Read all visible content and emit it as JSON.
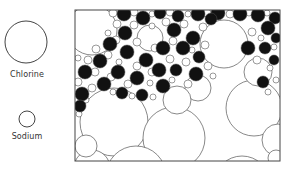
{
  "legend": {
    "chlorine": {
      "label": "Chlorine",
      "cx": 26,
      "cy": 42,
      "r": 21
    },
    "sodium": {
      "label": "Sodium",
      "cx": 27,
      "cy": 119,
      "r": 8
    }
  },
  "frame": {
    "x": 75,
    "y": 10,
    "width": 205,
    "height": 151
  },
  "colors": {
    "stroke": "#555555",
    "fill_dark": "#111111",
    "fill_light": "#ffffff",
    "text": "#333333"
  },
  "large_circles": [
    [
      92,
      30,
      25
    ],
    [
      224,
      44,
      24
    ],
    [
      114,
      122,
      34
    ],
    [
      174,
      138,
      31
    ],
    [
      254,
      108,
      28
    ],
    [
      136,
      176,
      30
    ],
    [
      198,
      196,
      34
    ],
    [
      92,
      168,
      18
    ],
    [
      86,
      146,
      11
    ],
    [
      198,
      88,
      13
    ],
    [
      242,
      184,
      28
    ],
    [
      278,
      140,
      16
    ],
    [
      276,
      158,
      8
    ],
    [
      177,
      100,
      14
    ],
    [
      150,
      38,
      13
    ],
    [
      258,
      72,
      14
    ]
  ],
  "dark_circles": [
    [
      124,
      14,
      7
    ],
    [
      143,
      18,
      7
    ],
    [
      160,
      13,
      6
    ],
    [
      178,
      16,
      6
    ],
    [
      198,
      14,
      7
    ],
    [
      218,
      13,
      7
    ],
    [
      240,
      14,
      7
    ],
    [
      258,
      15,
      7
    ],
    [
      275,
      18,
      6
    ],
    [
      125,
      33,
      7
    ],
    [
      174,
      30,
      7
    ],
    [
      193,
      38,
      7
    ],
    [
      211,
      19,
      6
    ],
    [
      268,
      28,
      7
    ],
    [
      110,
      44,
      7
    ],
    [
      127,
      52,
      7
    ],
    [
      146,
      60,
      7
    ],
    [
      163,
      48,
      7
    ],
    [
      183,
      48,
      7
    ],
    [
      199,
      57,
      6
    ],
    [
      248,
      48,
      7
    ],
    [
      265,
      48,
      6
    ],
    [
      276,
      38,
      5
    ],
    [
      100,
      61,
      7
    ],
    [
      118,
      72,
      7
    ],
    [
      137,
      78,
      7
    ],
    [
      159,
      70,
      7
    ],
    [
      176,
      70,
      6
    ],
    [
      196,
      74,
      7
    ],
    [
      85,
      72,
      7
    ],
    [
      104,
      84,
      7
    ],
    [
      122,
      93,
      6
    ],
    [
      142,
      95,
      6
    ],
    [
      163,
      86,
      7
    ],
    [
      82,
      94,
      7
    ],
    [
      263,
      82,
      6
    ],
    [
      274,
      60,
      5
    ],
    [
      80,
      106,
      6
    ]
  ],
  "small_circles": [
    [
      113,
      13,
      4
    ],
    [
      134,
      12,
      4
    ],
    [
      152,
      14,
      3
    ],
    [
      170,
      12,
      4
    ],
    [
      188,
      14,
      3
    ],
    [
      207,
      13,
      4
    ],
    [
      230,
      14,
      4
    ],
    [
      249,
      12,
      4
    ],
    [
      267,
      13,
      3
    ],
    [
      117,
      24,
      4
    ],
    [
      134,
      25,
      4
    ],
    [
      152,
      26,
      3
    ],
    [
      166,
      22,
      4
    ],
    [
      184,
      24,
      4
    ],
    [
      203,
      27,
      4
    ],
    [
      108,
      33,
      3
    ],
    [
      116,
      40,
      4
    ],
    [
      137,
      42,
      4
    ],
    [
      155,
      48,
      4
    ],
    [
      173,
      41,
      4
    ],
    [
      192,
      50,
      3
    ],
    [
      205,
      45,
      4
    ],
    [
      252,
      32,
      4
    ],
    [
      261,
      38,
      3
    ],
    [
      274,
      47,
      3
    ],
    [
      257,
      60,
      4
    ],
    [
      270,
      68,
      3
    ],
    [
      96,
      49,
      4
    ],
    [
      108,
      55,
      4
    ],
    [
      119,
      62,
      3
    ],
    [
      137,
      66,
      4
    ],
    [
      152,
      72,
      4
    ],
    [
      170,
      59,
      4
    ],
    [
      186,
      62,
      4
    ],
    [
      208,
      66,
      4
    ],
    [
      213,
      76,
      3
    ],
    [
      78,
      58,
      3
    ],
    [
      88,
      60,
      4
    ],
    [
      95,
      72,
      4
    ],
    [
      111,
      77,
      4
    ],
    [
      128,
      84,
      4
    ],
    [
      150,
      83,
      3
    ],
    [
      172,
      80,
      3
    ],
    [
      188,
      84,
      4
    ],
    [
      78,
      82,
      4
    ],
    [
      92,
      88,
      4
    ],
    [
      113,
      92,
      3
    ],
    [
      132,
      96,
      3
    ],
    [
      153,
      97,
      3
    ],
    [
      268,
      92,
      3
    ],
    [
      276,
      80,
      3
    ],
    [
      79,
      114,
      3
    ],
    [
      86,
      100,
      3
    ]
  ]
}
